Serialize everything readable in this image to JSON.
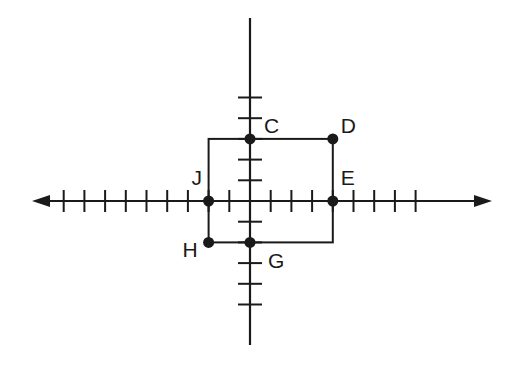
{
  "diagram": {
    "type": "coordinate-plane",
    "origin_px": [
      250,
      201
    ],
    "unit_px": 20.7,
    "x_axis": {
      "min_tick": -9,
      "max_tick": 8,
      "arrow_left_px": 32,
      "arrow_right_px": 492,
      "arrows": "both"
    },
    "y_axis": {
      "min_tick": -5,
      "max_tick": 5,
      "top_px": 18,
      "bottom_px": 345,
      "arrows": "none"
    },
    "colors": {
      "stroke": "#1a1a1a",
      "background": "#ffffff"
    },
    "points": [
      {
        "label": "C",
        "x": 0,
        "y": 3,
        "label_dx": 14,
        "label_dy": -6
      },
      {
        "label": "D",
        "x": 4,
        "y": 3,
        "label_dx": 8,
        "label_dy": -6
      },
      {
        "label": "J",
        "x": -2,
        "y": 0,
        "label_dx": -17,
        "label_dy": -16
      },
      {
        "label": "E",
        "x": 4,
        "y": 0,
        "label_dx": 8,
        "label_dy": -16
      },
      {
        "label": "H",
        "x": -2,
        "y": -2,
        "label_dx": -26,
        "label_dy": 15
      },
      {
        "label": "G",
        "x": 0,
        "y": -2,
        "label_dx": 18,
        "label_dy": 26
      }
    ],
    "rectangle": {
      "x1": -2,
      "y1": 3,
      "x2": 4,
      "y2": -2
    }
  }
}
